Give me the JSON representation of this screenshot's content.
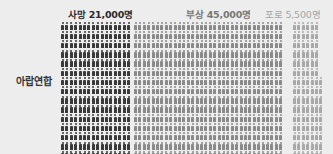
{
  "chart_data": {
    "type": "pictograph",
    "title": "",
    "row_label": "아랍연합",
    "unit_per_icon": 100,
    "series": [
      {
        "name": "사망",
        "label": "사망 21,000명",
        "value": 21000,
        "color": "#3a3a3a",
        "label_color": "#2a2a2a"
      },
      {
        "name": "부상",
        "label": "부상 45,000명",
        "value": 45000,
        "color": "#8a8a8a",
        "label_color": "#6a6a6a"
      },
      {
        "name": "포로",
        "label": "포로 5,500명",
        "value": 5500,
        "color": "#a8a8a8",
        "label_color": "#9a9a9a"
      }
    ]
  },
  "labels": {
    "row": "아랍연합",
    "death": "사망 21,000명",
    "wounded": "부상 45,000명",
    "pow": "포로 5,500명"
  }
}
